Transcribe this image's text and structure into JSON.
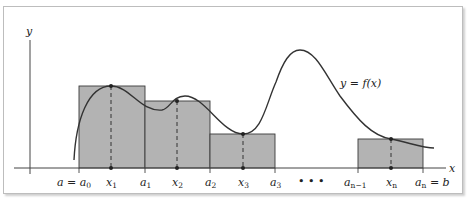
{
  "figure": {
    "axis_labels": {
      "x": "x",
      "y": "y"
    },
    "curve_label": "y = f(x)",
    "ellipsis": "• • •",
    "tick_labels": [
      {
        "id": "a0",
        "text": "a = a",
        "sub": "0",
        "x": 79
      },
      {
        "id": "x1",
        "text": "x",
        "sub": "1",
        "x": 111
      },
      {
        "id": "a1",
        "text": "a",
        "sub": "1",
        "x": 145
      },
      {
        "id": "x2",
        "text": "x",
        "sub": "2",
        "x": 177
      },
      {
        "id": "a2",
        "text": "a",
        "sub": "2",
        "x": 210
      },
      {
        "id": "x3",
        "text": "x",
        "sub": "3",
        "x": 243
      },
      {
        "id": "a3",
        "text": "a",
        "sub": "3",
        "x": 275
      },
      {
        "id": "an1",
        "text": "a",
        "sub": "n−1",
        "x": 358
      },
      {
        "id": "xn",
        "text": "x",
        "sub": "n",
        "x": 391
      },
      {
        "id": "an",
        "text": "a",
        "sub": "n",
        "suffix": " = b",
        "x": 423
      }
    ],
    "rectangles": [
      {
        "from": "a0",
        "to": "a1",
        "sample": "x1"
      },
      {
        "from": "a1",
        "to": "a2",
        "sample": "x2"
      },
      {
        "from": "a2",
        "to": "a3",
        "sample": "x3"
      },
      {
        "from": "an1",
        "to": "an",
        "sample": "xn"
      }
    ],
    "colors": {
      "rect_fill": "#b3b3b3",
      "rect_stroke": "#3a3a3a",
      "curve": "#333333",
      "axis": "#444444"
    }
  }
}
